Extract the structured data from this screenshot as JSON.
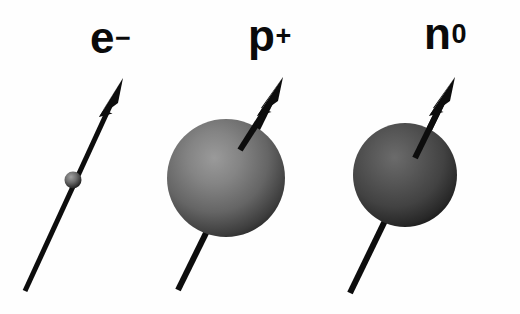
{
  "figure": {
    "background_color": "#fefefe",
    "width": 520,
    "height": 314,
    "stroke_color": "#0d0d0d"
  },
  "particles": [
    {
      "id": "electron",
      "symbol": "e",
      "charge": "−",
      "label": "e⁻",
      "name": "electron",
      "sphere": {
        "cx": 73,
        "cy": 180,
        "r": 8,
        "fill_light": "#8a8a8a",
        "fill_dark": "#1e1e1e"
      },
      "arrow": {
        "x1": 25,
        "y1": 291,
        "x2": 123,
        "y2": 78,
        "shaft_width": 5,
        "head_length": 34,
        "head_width": 17
      }
    },
    {
      "id": "proton",
      "symbol": "p",
      "charge": "+",
      "label": "p⁺",
      "name": "proton",
      "sphere": {
        "cx": 226,
        "cy": 178,
        "r": 59,
        "fill_light": "#8c8c8c",
        "fill_dark": "#262626"
      },
      "arrow": {
        "x1": 178,
        "y1": 290,
        "x2": 283,
        "y2": 77,
        "shaft_width": 6,
        "head_length": 36,
        "head_width": 18
      }
    },
    {
      "id": "neutron",
      "symbol": "n",
      "charge": "0",
      "label": "n⁰",
      "name": "neutron",
      "sphere": {
        "cx": 405,
        "cy": 175,
        "r": 52,
        "fill_light": "#5c5c5c",
        "fill_dark": "#171717"
      },
      "arrow": {
        "x1": 350,
        "y1": 293,
        "x2": 455,
        "y2": 77,
        "shaft_width": 6,
        "head_length": 36,
        "head_width": 18
      }
    }
  ]
}
